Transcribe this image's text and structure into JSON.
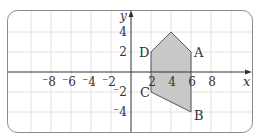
{
  "diagram": {
    "type": "coordinate-plane-polygon",
    "axes": {
      "x_label": "x",
      "y_label": "y",
      "x_ticks": [
        {
          "value": -8,
          "label": "⁻8"
        },
        {
          "value": -6,
          "label": "⁻6"
        },
        {
          "value": -4,
          "label": "⁻4"
        },
        {
          "value": -2,
          "label": "⁻2"
        },
        {
          "value": 2,
          "label": "2"
        },
        {
          "value": 4,
          "label": "4"
        },
        {
          "value": 6,
          "label": "6"
        },
        {
          "value": 8,
          "label": "8"
        }
      ],
      "y_ticks": [
        {
          "value": 4,
          "label": "4"
        },
        {
          "value": 2,
          "label": "2"
        },
        {
          "value": -2,
          "label": "⁻2"
        },
        {
          "value": -4,
          "label": "⁻4"
        }
      ]
    },
    "polygon": {
      "fill": "#c8c8c8",
      "stroke": "#555555",
      "vertices": [
        {
          "name": "D",
          "x": 2,
          "y": 2
        },
        {
          "name": "",
          "x": 4,
          "y": 4
        },
        {
          "name": "A",
          "x": 6,
          "y": 2
        },
        {
          "name": "B",
          "x": 6,
          "y": -4
        },
        {
          "name": "C",
          "x": 2,
          "y": -2
        }
      ]
    },
    "vertex_labels": {
      "A": "A",
      "B": "B",
      "C": "C",
      "D": "D"
    },
    "colors": {
      "grid": "#e2e2e2",
      "axis": "#333333",
      "frame": "#8a8a8a",
      "text": "#333333"
    }
  }
}
